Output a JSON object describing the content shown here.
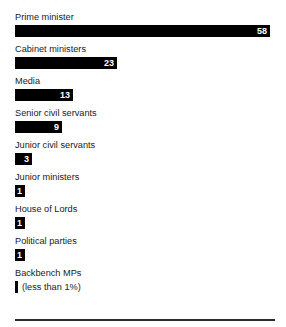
{
  "top_crop_artifact": "· ·",
  "footer": {
    "rule": "horizontal-rule"
  },
  "chart_data": {
    "type": "bar",
    "orientation": "horizontal",
    "title": "",
    "subtitle": "",
    "xlabel": "",
    "ylabel": "",
    "grid": false,
    "legend": null,
    "xlim": [
      0,
      58
    ],
    "unit": "%",
    "categories": [
      "Prime minister",
      "Cabinet ministers",
      "Media",
      "Senior civil servants",
      "Junior civil servants",
      "Junior ministers",
      "House of Lords",
      "Political parties",
      "Backbench MPs"
    ],
    "values": [
      58,
      23,
      13,
      9,
      3,
      1,
      1,
      1,
      0
    ],
    "value_labels": [
      "58",
      "23",
      "13",
      "9",
      "3",
      "1",
      "1",
      "1",
      ""
    ],
    "bars": [
      {
        "label": "Prime minister",
        "value": 58,
        "value_label": "58",
        "width_px": 255,
        "inside_label": true,
        "note": ""
      },
      {
        "label": "Cabinet ministers",
        "value": 23,
        "value_label": "23",
        "width_px": 102,
        "inside_label": true,
        "note": ""
      },
      {
        "label": "Media",
        "value": 13,
        "value_label": "13",
        "width_px": 58,
        "inside_label": true,
        "note": ""
      },
      {
        "label": "Senior civil servants",
        "value": 9,
        "value_label": "9",
        "width_px": 47,
        "inside_label": true,
        "note": ""
      },
      {
        "label": "Junior civil servants",
        "value": 3,
        "value_label": "3",
        "width_px": 17,
        "inside_label": true,
        "note": ""
      },
      {
        "label": "Junior ministers",
        "value": 1,
        "value_label": "1",
        "width_px": 10,
        "inside_label": true,
        "note": ""
      },
      {
        "label": "House of Lords",
        "value": 1,
        "value_label": "1",
        "width_px": 10,
        "inside_label": true,
        "note": ""
      },
      {
        "label": "Political parties",
        "value": 1,
        "value_label": "1",
        "width_px": 10,
        "inside_label": true,
        "note": ""
      },
      {
        "label": "Backbench MPs",
        "value": 0,
        "value_label": "",
        "width_px": 3,
        "inside_label": false,
        "note": "(less than 1%)"
      }
    ],
    "colors": {
      "bar": "#000000",
      "value_text": "#ffffff",
      "label_text": "#1a1a1a",
      "background": "#ffffff",
      "rule": "#2b2b2b"
    }
  }
}
